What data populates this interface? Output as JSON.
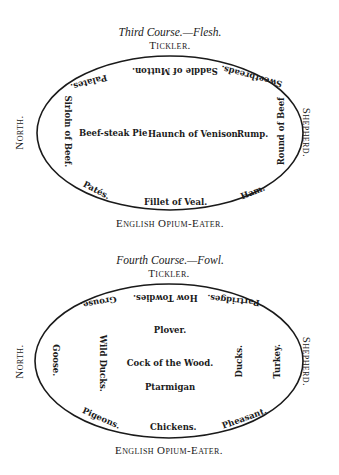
{
  "third_course": {
    "heading": "Third Course.—Flesh.",
    "top_label": "Tickler.",
    "bottom_label": "English Opium-Eater.",
    "left_label": "North.",
    "right_label": "Shepherd.",
    "dishes": {
      "top_left": "Palates.",
      "top_center": "Saddle of Mutton.",
      "top_right": "Sweetbreads.",
      "left": "Sirloin of Beef.",
      "right": "Round of Beef",
      "center_left": "Beef-steak Pie",
      "center": "Haunch of Venison.",
      "center_right": "Rump.",
      "bottom_left": "Patés.",
      "bottom_center": "Fillet of Veal.",
      "bottom_right": "Ham."
    }
  },
  "fourth_course": {
    "heading": "Fourth Course.—Fowl.",
    "top_label": "Tickler.",
    "bottom_label": "English Opium-Eater.",
    "left_label": "North.",
    "right_label": "Shepherd.",
    "dishes": {
      "top_left": "Grouse.",
      "top_center": "How Towdies.",
      "top_right": "Partridges.",
      "far_left": "Goose.",
      "left": "Wild Ducks.",
      "center_top": "Plover.",
      "center": "Cock of the Wood.",
      "center_bottom": "Ptarmigan",
      "right": "Ducks.",
      "far_right": "Turkey.",
      "bottom_left": "Pigeons.",
      "bottom_center": "Chickens.",
      "bottom_right": "Pheasant."
    }
  }
}
